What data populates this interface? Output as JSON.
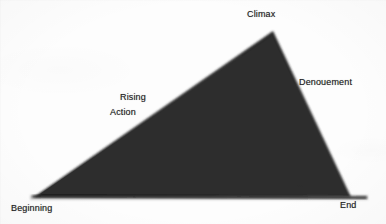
{
  "diagram": {
    "type": "plot-structure-triangle",
    "shape": {
      "fill_color": "#2e2e2e",
      "baseline_color": "#1f1f1f",
      "background_color": "#fdfdfd",
      "vertices": {
        "beginning": [
          34,
          197
        ],
        "climax": [
          273,
          31
        ],
        "end": [
          351,
          197
        ]
      },
      "baseline_extends_to_x": 366
    },
    "labels": {
      "climax": "Climax",
      "denouement": "Denouement",
      "rising_line1": "Rising",
      "rising_line2": "Action",
      "beginning": "Beginning",
      "end": "End"
    },
    "label_color": "#232323"
  }
}
